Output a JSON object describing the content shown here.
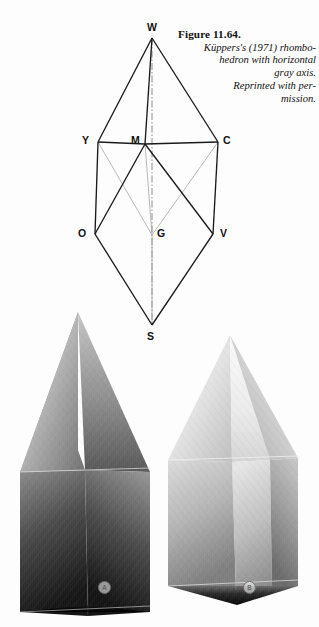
{
  "figure": {
    "number": "Figure 11.64.",
    "caption_line1": "Küppers's (1971) rhombo-",
    "caption_line2": "hedron with  horizontal",
    "caption_line3": "gray axis.",
    "caption_line4": "Reprinted with per-",
    "caption_line5": "mission."
  },
  "diagram": {
    "type": "rhombohedron-wireframe",
    "axis_name": "gray axis",
    "axis_style": "dash-dot vertical",
    "vertices": [
      {
        "id": "W",
        "label": "W",
        "meaning": "white",
        "x": 152,
        "y": 38,
        "label_x": 147,
        "label_y": 22
      },
      {
        "id": "Y",
        "label": "Y",
        "meaning": "yellow",
        "x": 98,
        "y": 142,
        "label_x": 82,
        "label_y": 135
      },
      {
        "id": "M",
        "label": "M",
        "meaning": "magenta",
        "x": 145,
        "y": 144,
        "label_x": 131,
        "label_y": 135
      },
      {
        "id": "C",
        "label": "C",
        "meaning": "cyan",
        "x": 218,
        "y": 142,
        "label_x": 223,
        "label_y": 135
      },
      {
        "id": "O",
        "label": "O",
        "meaning": "orange-red",
        "x": 95,
        "y": 234,
        "label_x": 78,
        "label_y": 228
      },
      {
        "id": "G",
        "label": "G",
        "meaning": "gray",
        "x": 152,
        "y": 235,
        "label_x": 157,
        "label_y": 228
      },
      {
        "id": "V",
        "label": "V",
        "meaning": "violet-blue",
        "x": 213,
        "y": 234,
        "label_x": 220,
        "label_y": 228
      },
      {
        "id": "S",
        "label": "S",
        "meaning": "black",
        "x": 152,
        "y": 325,
        "label_x": 147,
        "label_y": 331
      }
    ],
    "solid_edges": [
      [
        "W",
        "Y"
      ],
      [
        "W",
        "C"
      ],
      [
        "W",
        "M"
      ],
      [
        "Y",
        "O"
      ],
      [
        "C",
        "V"
      ],
      [
        "M",
        "O"
      ],
      [
        "M",
        "V"
      ],
      [
        "O",
        "S"
      ],
      [
        "V",
        "S"
      ],
      [
        "Y",
        "M"
      ],
      [
        "M",
        "C"
      ]
    ],
    "hidden_edges": [
      [
        "Y",
        "G"
      ],
      [
        "C",
        "G"
      ],
      [
        "G",
        "S"
      ],
      [
        "M",
        "G"
      ]
    ],
    "colors": {
      "edge": "#1a1a1a",
      "hidden_edge": "#9a9a9a",
      "axis": "#7a7a7a",
      "label": "#121212",
      "background": "#fdfdfd"
    }
  },
  "solids": [
    {
      "id": "A",
      "label": "A",
      "label_x": 98,
      "label_y": 581,
      "description": "shaded rhombohedron, dark rendering",
      "apex_top": {
        "x": 78,
        "y": 312
      },
      "apex_bottom": {
        "x": 88,
        "y": 605
      },
      "left_x": 20,
      "right_x": 150
    },
    {
      "id": "B",
      "label": "B",
      "label_x": 243,
      "label_y": 581,
      "description": "shaded rhombohedron, light rendering",
      "apex_top": {
        "x": 230,
        "y": 335
      },
      "apex_bottom": {
        "x": 237,
        "y": 605
      },
      "left_x": 168,
      "right_x": 298
    }
  ]
}
